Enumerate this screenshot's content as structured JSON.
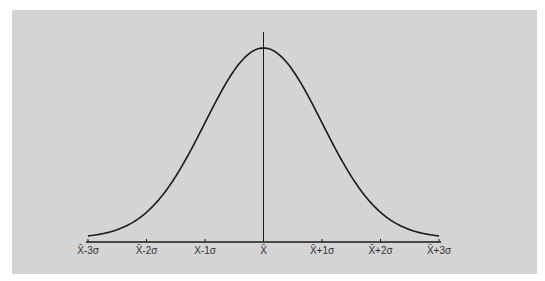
{
  "chart_data": {
    "type": "line",
    "title": "",
    "xlabel": "",
    "ylabel": "",
    "x_ticks": [
      -3,
      -2,
      -1,
      0,
      1,
      2,
      3
    ],
    "tick_labels": [
      "X̄-3σ",
      "X̄-2σ",
      "X-1σ",
      "X̄",
      "X̄+1σ",
      "X̄+2σ",
      "X̄+3σ"
    ],
    "xlim": [
      -3,
      3
    ],
    "series": [
      {
        "name": "normal-curve",
        "distribution": "normal",
        "mean": 0,
        "sd": 1
      }
    ],
    "mean_line": 0,
    "grid": false,
    "colors": {
      "background": "#d4d4d4",
      "line": "#1a1a1a"
    }
  }
}
